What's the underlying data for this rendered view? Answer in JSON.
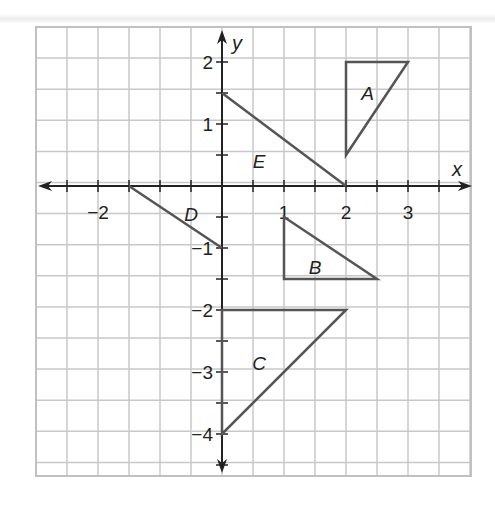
{
  "axes": {
    "x_label": "x",
    "y_label": "y",
    "x_ticks": [
      {
        "v": -2,
        "label": "−2"
      },
      {
        "v": 1,
        "label": "1"
      },
      {
        "v": 2,
        "label": "2"
      },
      {
        "v": 3,
        "label": "3"
      }
    ],
    "y_ticks": [
      {
        "v": 2,
        "label": "2"
      },
      {
        "v": 1,
        "label": "1"
      },
      {
        "v": -1,
        "label": "−1"
      },
      {
        "v": -2,
        "label": "−2"
      },
      {
        "v": -3,
        "label": "−3"
      },
      {
        "v": -4,
        "label": "−4"
      }
    ]
  },
  "figures": [
    {
      "label": "A",
      "points": [
        [
          2,
          2
        ],
        [
          3,
          2
        ],
        [
          2,
          0.5
        ]
      ],
      "label_pos": [
        2.35,
        1.5
      ]
    },
    {
      "label": "B",
      "points": [
        [
          1,
          -0.5
        ],
        [
          1,
          -1.5
        ],
        [
          2.5,
          -1.5
        ]
      ],
      "label_pos": [
        1.5,
        -1.3
      ]
    },
    {
      "label": "C",
      "points": [
        [
          0,
          -2
        ],
        [
          2,
          -2
        ],
        [
          0,
          -4
        ]
      ],
      "label_pos": [
        0.6,
        -2.85
      ]
    },
    {
      "label": "D",
      "points": [
        [
          -1.5,
          0
        ],
        [
          0,
          -1
        ]
      ],
      "label_pos": [
        -0.5,
        -0.45
      ]
    },
    {
      "label": "E",
      "points": [
        [
          0,
          1.5
        ],
        [
          2,
          0
        ]
      ],
      "label_pos": [
        0.6,
        0.4
      ]
    }
  ],
  "colors": {
    "grid": "#c8c8c8",
    "axis": "#222222",
    "shape": "#555555"
  }
}
